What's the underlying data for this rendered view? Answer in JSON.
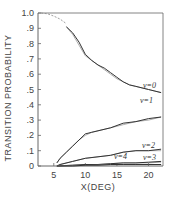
{
  "chart_data": {
    "type": "line",
    "title": "",
    "xlabel": "X(DEG)",
    "ylabel": "TRANSITION PROBABILITY",
    "xlim": [
      2.5,
      22.3
    ],
    "ylim": [
      0,
      1.0
    ],
    "x_ticks": [
      5,
      10,
      15,
      20
    ],
    "x_tick_labels": [
      "5",
      "10",
      "15",
      "20"
    ],
    "y_ticks": [
      0,
      0.1,
      0.2,
      0.3,
      0.4,
      0.5,
      0.6,
      0.7,
      0.8,
      0.9,
      1.0
    ],
    "y_tick_labels": [
      "0",
      ".1",
      ".2",
      ".3",
      ".4",
      ".5",
      ".6",
      ".7",
      ".8",
      ".9",
      "1.0"
    ],
    "grid": false,
    "frame": "box (top and right border lines)",
    "legend": "inline labels at right end of each curve",
    "series": [
      {
        "name": "ν=0",
        "label": "ν=0",
        "dashed_extrapolation": {
          "x": [
            3,
            4,
            5,
            6,
            7
          ],
          "y": [
            1.0,
            0.995,
            0.98,
            0.96,
            0.93
          ]
        },
        "x": [
          7,
          8,
          9,
          10,
          11,
          12,
          13,
          14,
          15,
          16,
          17,
          18,
          20,
          22
        ],
        "values": [
          0.91,
          0.87,
          0.81,
          0.73,
          0.69,
          0.66,
          0.64,
          0.61,
          0.58,
          0.55,
          0.53,
          0.52,
          0.5,
          0.48
        ],
        "theory_values": [
          0.91,
          0.86,
          0.79,
          0.72,
          0.69,
          0.66,
          0.63,
          0.6,
          0.57,
          0.55,
          0.53,
          0.52,
          0.5,
          0.48
        ]
      },
      {
        "name": "ν=1",
        "label": "ν=1",
        "x": [
          5.5,
          6,
          7,
          8,
          9,
          10,
          11,
          12,
          14,
          16,
          18,
          20,
          22
        ],
        "values": [
          0.02,
          0.05,
          0.09,
          0.13,
          0.17,
          0.21,
          0.22,
          0.23,
          0.25,
          0.28,
          0.29,
          0.31,
          0.32
        ],
        "theory_values": [
          0.02,
          0.05,
          0.09,
          0.13,
          0.17,
          0.2,
          0.22,
          0.23,
          0.25,
          0.27,
          0.29,
          0.3,
          0.32
        ]
      },
      {
        "name": "ν=2",
        "label": "ν=2",
        "x": [
          5.5,
          6,
          8,
          10,
          12,
          14,
          16,
          18,
          20,
          22
        ],
        "values": [
          0.0,
          0.01,
          0.03,
          0.05,
          0.06,
          0.07,
          0.09,
          0.1,
          0.1,
          0.11
        ],
        "theory_values": [
          0.0,
          0.01,
          0.03,
          0.05,
          0.06,
          0.07,
          0.09,
          0.1,
          0.1,
          0.1
        ]
      },
      {
        "name": "ν=3",
        "label": "ν=3",
        "x": [
          5.5,
          8,
          10,
          12,
          14,
          16,
          18,
          20,
          22
        ],
        "values": [
          0.0,
          0.005,
          0.01,
          0.01,
          0.015,
          0.02,
          0.02,
          0.025,
          0.03
        ],
        "theory_values": [
          0.0,
          0.005,
          0.01,
          0.01,
          0.015,
          0.02,
          0.02,
          0.02,
          0.025
        ]
      },
      {
        "name": "ν=4",
        "label": "ν=4",
        "x": [
          5.5,
          8,
          10,
          12,
          14,
          16,
          18,
          20,
          22
        ],
        "values": [
          0.0,
          0.0,
          0.005,
          0.005,
          0.01,
          0.01,
          0.01,
          0.01,
          0.01
        ],
        "theory_values": [
          0.0,
          0.0,
          0.003,
          0.005,
          0.008,
          0.01,
          0.01,
          0.01,
          0.01
        ]
      }
    ],
    "colors": {
      "axis": "#666666",
      "line": "#333333",
      "text": "#444444",
      "background": "#ffffff"
    }
  }
}
